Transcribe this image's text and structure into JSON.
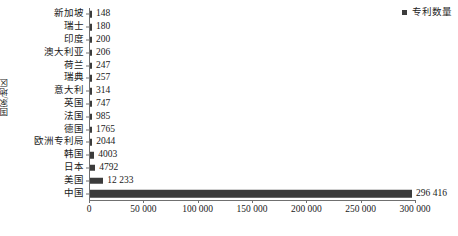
{
  "chart_data": {
    "type": "bar",
    "orientation": "horizontal",
    "title": "",
    "xlabel": "",
    "ylabel": "国家/地区",
    "xlim": [
      0,
      300000
    ],
    "xticks": [
      0,
      50000,
      100000,
      150000,
      200000,
      250000,
      300000
    ],
    "xticklabels": [
      "0",
      "50 000",
      "100 000",
      "150 000",
      "200 000",
      "250 000",
      "300 000"
    ],
    "grid": false,
    "legend": {
      "position": "top-right",
      "entries": [
        {
          "label": "专利数量",
          "color": "#3c3c3c",
          "marker": "square"
        }
      ]
    },
    "series": [
      {
        "name": "专利数量",
        "color": "#3c3c3c",
        "categories": [
          "新加坡",
          "瑞士",
          "印度",
          "澳大利亚",
          "荷兰",
          "瑞典",
          "意大利",
          "英国",
          "法国",
          "德国",
          "欧洲专利局",
          "韩国",
          "日本",
          "美国",
          "中国"
        ],
        "values": [
          148,
          180,
          200,
          206,
          247,
          257,
          314,
          747,
          985,
          1765,
          2044,
          4003,
          4792,
          12233,
          296416
        ],
        "value_labels": [
          "148",
          "180",
          "200",
          "206",
          "247",
          "257",
          "314",
          "747",
          "985",
          "1765",
          "2044",
          "4003",
          "4792",
          "12 233",
          "296 416"
        ]
      }
    ]
  },
  "colors": {
    "bar": "#3c3c3c",
    "axis": "#707070",
    "text": "#1a1a1a",
    "background": "#ffffff"
  }
}
